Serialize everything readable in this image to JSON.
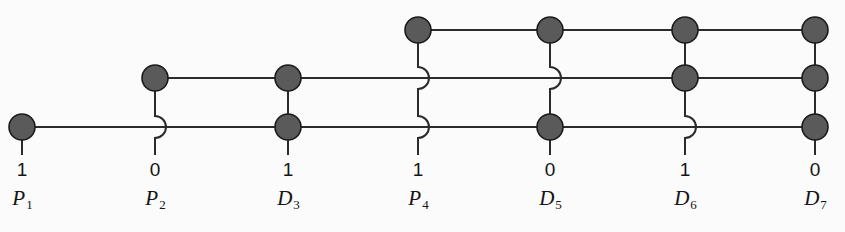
{
  "diagram": {
    "background_color": "#fbfbfb",
    "node_fill": "#5a5a5a",
    "node_stroke": "#1a1a1a",
    "wire_color": "#2b2b2b",
    "node_radius": 13,
    "wire_width": 2,
    "columns": [
      {
        "id": "p1",
        "name": "P",
        "index": "1",
        "bit": "1",
        "x": 22,
        "nodes": [
          "bottom"
        ],
        "hops": []
      },
      {
        "id": "p2",
        "name": "P",
        "index": "2",
        "bit": "0",
        "x": 155,
        "nodes": [
          "middle"
        ],
        "hops": [
          "bottom"
        ]
      },
      {
        "id": "d3",
        "name": "D",
        "index": "3",
        "bit": "1",
        "x": 288,
        "nodes": [
          "middle",
          "bottom"
        ],
        "hops": []
      },
      {
        "id": "p4",
        "name": "P",
        "index": "4",
        "bit": "1",
        "x": 418,
        "nodes": [
          "top"
        ],
        "hops": [
          "middle",
          "bottom"
        ]
      },
      {
        "id": "d5",
        "name": "D",
        "index": "5",
        "bit": "0",
        "x": 550,
        "nodes": [
          "top",
          "bottom"
        ],
        "hops": [
          "middle"
        ]
      },
      {
        "id": "d6",
        "name": "D",
        "index": "6",
        "bit": "1",
        "x": 685,
        "nodes": [
          "top",
          "middle"
        ],
        "hops": [
          "bottom"
        ]
      },
      {
        "id": "d7",
        "name": "D",
        "index": "7",
        "bit": "0",
        "x": 815,
        "nodes": [
          "top",
          "middle",
          "bottom"
        ],
        "hops": []
      }
    ],
    "rows": [
      {
        "id": "top",
        "y": 30,
        "x_start": 418,
        "x_end": 815
      },
      {
        "id": "middle",
        "y": 78,
        "x_start": 155,
        "x_end": 815
      },
      {
        "id": "bottom",
        "y": 127,
        "x_start": 22,
        "x_end": 815
      }
    ],
    "bit_label_y": 160,
    "col_label_y": 188,
    "stub_bottom_y": 155
  }
}
